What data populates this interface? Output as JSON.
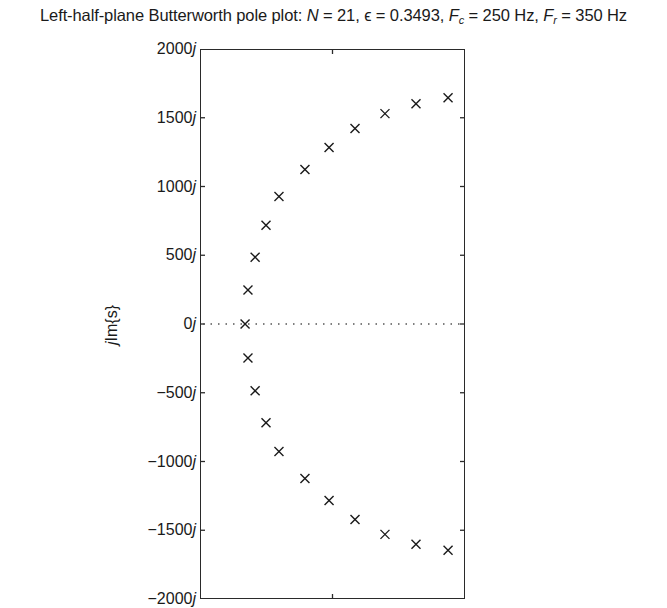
{
  "chart_data": {
    "type": "scatter",
    "title": "Left-half-plane Butterworth pole plot:  N = 21, ϵ = 0.3493, Fc = 250 Hz, Fr = 350 Hz",
    "title_parts": {
      "prefix": "Left-half-plane Butterworth pole plot:  ",
      "n_label": "N",
      "n_value": " = 21, ",
      "eps_symbol": "ϵ",
      "eps_value": " = 0.3493, ",
      "fc_label": "F",
      "fc_sub": "c",
      "fc_value": " = 250 Hz, ",
      "fr_label": "F",
      "fr_sub": "r",
      "fr_value": " = 350 Hz"
    },
    "xlabel": "",
    "ylabel": "jIm{s}",
    "ylabel_parts": {
      "j": "j",
      "rest": "Im{s}"
    },
    "ylim": [
      -2000,
      2000
    ],
    "yticks": [
      2000,
      1500,
      1000,
      500,
      0,
      -500,
      -1000,
      -1500,
      -2000
    ],
    "ytick_labels": [
      "2000j",
      "1500j",
      "1000j",
      "500j",
      "0j",
      "−500j",
      "−1000j",
      "−1500j",
      "−2000j"
    ],
    "xticks_visible": "one unlabeled tick at plot center",
    "grid": false,
    "zero_line": {
      "y": 0,
      "style": "dotted"
    },
    "marker": "x",
    "series": [
      {
        "name": "poles",
        "x_fraction_of_plot_width": [
          0.17,
          0.181,
          0.208,
          0.249,
          0.298,
          0.362,
          0.434,
          0.509,
          0.581,
          0.672,
          0.79,
          0.925,
          0.17,
          0.181,
          0.208,
          0.249,
          0.298,
          0.362,
          0.434,
          0.509,
          0.581,
          0.672,
          0.79,
          0.925
        ],
        "points": [
          {
            "im": 0,
            "xf": 0.17
          },
          {
            "im": 247,
            "xf": 0.181
          },
          {
            "im": 486,
            "xf": 0.208
          },
          {
            "im": 718,
            "xf": 0.249
          },
          {
            "im": 928,
            "xf": 0.298
          },
          {
            "im": 1124,
            "xf": 0.396
          },
          {
            "im": 1283,
            "xf": 0.487
          },
          {
            "im": 1421,
            "xf": 0.585
          },
          {
            "im": 1530,
            "xf": 0.698
          },
          {
            "im": 1602,
            "xf": 0.815
          },
          {
            "im": 1646,
            "xf": 0.936
          },
          {
            "im": -247,
            "xf": 0.181
          },
          {
            "im": -486,
            "xf": 0.208
          },
          {
            "im": -718,
            "xf": 0.249
          },
          {
            "im": -928,
            "xf": 0.298
          },
          {
            "im": -1124,
            "xf": 0.396
          },
          {
            "im": -1283,
            "xf": 0.487
          },
          {
            "im": -1421,
            "xf": 0.585
          },
          {
            "im": -1530,
            "xf": 0.698
          },
          {
            "im": -1602,
            "xf": 0.815
          },
          {
            "im": -1646,
            "xf": 0.936
          }
        ]
      }
    ]
  }
}
